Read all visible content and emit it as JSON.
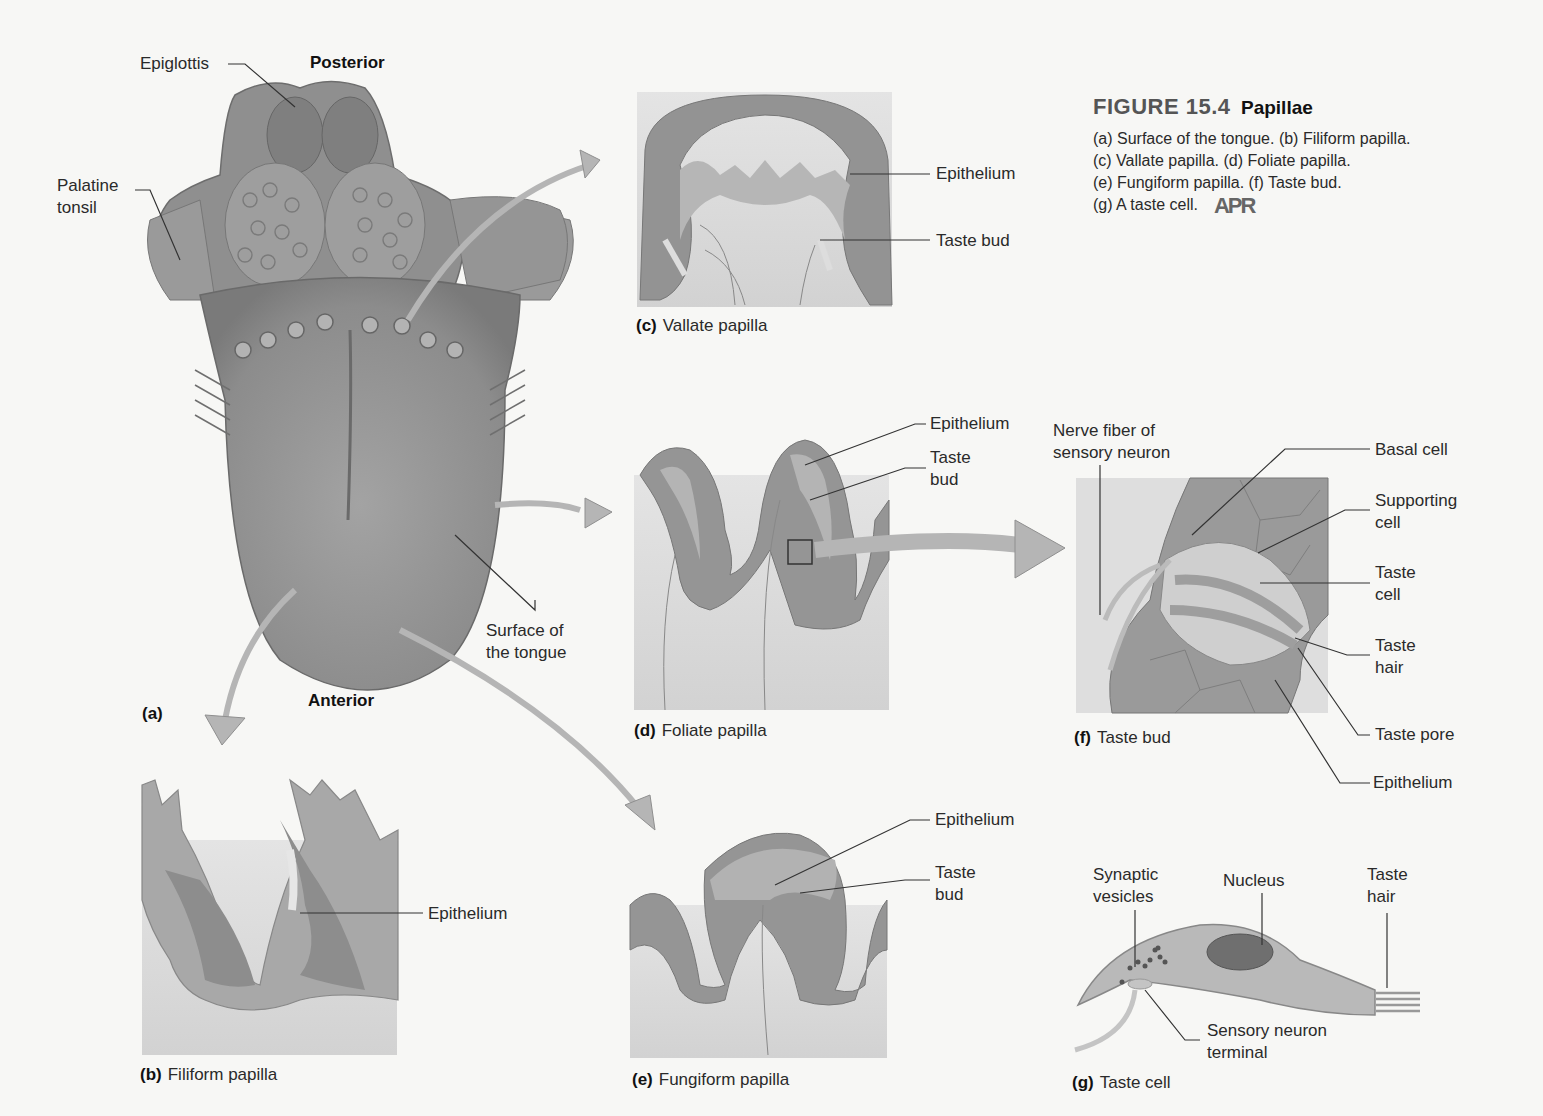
{
  "figure": {
    "number": "FIGURE 15.4",
    "title": "Papillae",
    "description_lines": [
      "(a) Surface of the tongue. (b) Filiform papilla.",
      "(c) Vallate papilla. (d) Foliate papilla.",
      "(e) Fungiform papilla. (f) Taste bud.",
      "(g) A taste cell."
    ],
    "badge": "APR"
  },
  "panel_a": {
    "letter": "(a)",
    "orientation_top": "Posterior",
    "orientation_bottom": "Anterior",
    "labels": {
      "epiglottis": "Epiglottis",
      "palatine_tonsil": "Palatine\ntonsil",
      "surface": "Surface of\nthe tongue"
    }
  },
  "panel_b": {
    "letter": "(b)",
    "caption": "Filiform papilla",
    "labels": {
      "epithelium": "Epithelium"
    }
  },
  "panel_c": {
    "letter": "(c)",
    "caption": "Vallate papilla",
    "labels": {
      "epithelium": "Epithelium",
      "taste_bud": "Taste bud"
    }
  },
  "panel_d": {
    "letter": "(d)",
    "caption": "Foliate papilla",
    "labels": {
      "epithelium": "Epithelium",
      "taste_bud": "Taste\nbud"
    }
  },
  "panel_e": {
    "letter": "(e)",
    "caption": "Fungiform papilla",
    "labels": {
      "epithelium": "Epithelium",
      "taste_bud": "Taste\nbud"
    }
  },
  "panel_f": {
    "letter": "(f)",
    "caption": "Taste bud",
    "labels": {
      "nerve_fiber": "Nerve fiber of\nsensory neuron",
      "basal_cell": "Basal cell",
      "supporting_cell": "Supporting\ncell",
      "taste_cell": "Taste\ncell",
      "taste_hair": "Taste\nhair",
      "taste_pore": "Taste pore",
      "epithelium": "Epithelium"
    }
  },
  "panel_g": {
    "letter": "(g)",
    "caption": "Taste cell",
    "labels": {
      "synaptic_vesicles": "Synaptic\nvesicles",
      "nucleus": "Nucleus",
      "taste_hair": "Taste\nhair",
      "sensory_terminal": "Sensory neuron\nterminal"
    }
  },
  "colors": {
    "tissue_dark": "#8a8a8a",
    "tissue_mid": "#a9a9a9",
    "tissue_light": "#cfcfcf",
    "arrow": "#b8b8b8",
    "leader": "#333333"
  }
}
